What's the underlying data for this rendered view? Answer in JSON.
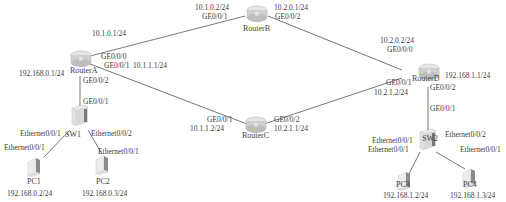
{
  "diagram": {
    "type": "network-topology",
    "nodes": [
      {
        "id": "routerA",
        "label": "RouterA",
        "kind": "router",
        "icon": "router-icon"
      },
      {
        "id": "routerB",
        "label": "RouterB",
        "kind": "router",
        "icon": "router-icon"
      },
      {
        "id": "routerC",
        "label": "RouterC",
        "kind": "router",
        "icon": "router-icon"
      },
      {
        "id": "routerD",
        "label": "RouterD",
        "kind": "router",
        "icon": "router-icon"
      },
      {
        "id": "sw1",
        "label": "SW1",
        "kind": "switch",
        "icon": "switch-icon"
      },
      {
        "id": "sw2",
        "label": "SW2",
        "kind": "switch",
        "icon": "switch-icon"
      },
      {
        "id": "pc1",
        "label": "PC1",
        "kind": "pc",
        "icon": "pc-icon",
        "ip": "192.168.0.2/24"
      },
      {
        "id": "pc2",
        "label": "PC2",
        "kind": "pc",
        "icon": "pc-icon",
        "ip": "192.168.0.3/24"
      },
      {
        "id": "pc3",
        "label": "PC3",
        "kind": "pc",
        "icon": "pc-icon",
        "ip": "192.168.1.2/24"
      },
      {
        "id": "pc4",
        "label": "PC4",
        "kind": "pc",
        "icon": "pc-icon",
        "ip": "192.168.1.3/24"
      }
    ],
    "labels": {
      "ra_b_ip": "10.1.0.1/24",
      "ra_ge000": "GE0/0/0",
      "ra_ge001": "GE0/0/1",
      "ra_c_ip": "10.1.1.1/24",
      "ra_lan_ip": "192.168.0.1/24",
      "ra_ge002": "GE0/0/2",
      "rb_a_ip": "10.1.0.2/24",
      "rb_ge001": "GE0/0/1",
      "rb_d_ip": "10.2.0.1/24",
      "rb_ge002": "GE0/0/2",
      "rd_b_ip": "10.2.0.2/24",
      "rd_ge000": "GE0/0/0",
      "rd_ge001": "GE0/0/1",
      "rd_c_ip": "10.2.1.2/24",
      "rd_lan_ip": "192.168.1.1/24",
      "rd_ge002": "GE0/0/2",
      "rc_ge001": "GE0/0/1",
      "rc_a_ip": "10.1.1.2/24",
      "rc_ge002": "GE0/0/2",
      "rc_d_ip": "10.2.1.1/24",
      "sw1_ge001": "GE0/0/1",
      "sw1_eth001": "Ethernet0/0/1",
      "sw1_eth002": "Ethernet0/0/2",
      "pc1_eth001": "Ethernet0/0/1",
      "pc2_eth001": "Ethernet0/0/1",
      "sw2_ge001": "GE0/0/1",
      "sw2_eth001": "Ethernet0/0/1",
      "sw2_eth002": "Ethernet0/0/2",
      "pc3_eth001": "Ethernet0/0/1",
      "pc4_eth001": "Ethernet0/0/1"
    },
    "links": [
      {
        "from": "routerA",
        "from_port": "GE0/0/0",
        "from_ip": "10.1.0.1/24",
        "to": "routerB",
        "to_port": "GE0/0/1",
        "to_ip": "10.1.0.2/24"
      },
      {
        "from": "routerB",
        "from_port": "GE0/0/2",
        "from_ip": "10.2.0.1/24",
        "to": "routerD",
        "to_port": "GE0/0/0",
        "to_ip": "10.2.0.2/24"
      },
      {
        "from": "routerA",
        "from_port": "GE0/0/1",
        "from_ip": "10.1.1.1/24",
        "to": "routerC",
        "to_port": "GE0/0/1",
        "to_ip": "10.1.1.2/24"
      },
      {
        "from": "routerC",
        "from_port": "GE0/0/2",
        "from_ip": "10.2.1.1/24",
        "to": "routerD",
        "to_port": "GE0/0/1",
        "to_ip": "10.2.1.2/24"
      },
      {
        "from": "routerA",
        "from_port": "GE0/0/2",
        "from_ip": "192.168.0.1/24",
        "to": "sw1",
        "to_port": "GE0/0/1"
      },
      {
        "from": "routerD",
        "from_port": "GE0/0/2",
        "from_ip": "192.168.1.1/24",
        "to": "sw2",
        "to_port": "GE0/0/1"
      },
      {
        "from": "sw1",
        "from_port": "Ethernet0/0/1",
        "to": "pc1",
        "to_port": "Ethernet0/0/1"
      },
      {
        "from": "sw1",
        "from_port": "Ethernet0/0/2",
        "to": "pc2",
        "to_port": "Ethernet0/0/1"
      },
      {
        "from": "sw2",
        "from_port": "Ethernet0/0/1",
        "to": "pc3",
        "to_port": "Ethernet0/0/1"
      },
      {
        "from": "sw2",
        "from_port": "Ethernet0/0/2",
        "to": "pc4",
        "to_port": "Ethernet0/0/1"
      }
    ],
    "colors": {
      "line": "#555555",
      "text": "#3a3a3a",
      "device_body": "#c8c8c8"
    }
  }
}
